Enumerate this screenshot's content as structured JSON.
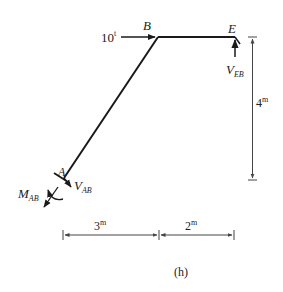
{
  "diagram": {
    "type": "structural-frame-free-body",
    "caption": "(h)",
    "nodes": {
      "A": {
        "label": "A"
      },
      "B": {
        "label": "B"
      },
      "E": {
        "label": "E"
      }
    },
    "load": {
      "value": "10",
      "unit": "t",
      "direction": "right",
      "at": "B"
    },
    "reactions": {
      "V_AB": {
        "main": "V",
        "sub": "AB"
      },
      "M_AB": {
        "main": "M",
        "sub": "AB"
      },
      "V_EB": {
        "main": "V",
        "sub": "EB"
      }
    },
    "dimensions": {
      "height": {
        "value": "4",
        "unit": "m"
      },
      "span_left": {
        "value": "3",
        "unit": "m"
      },
      "span_right": {
        "value": "2",
        "unit": "m"
      }
    },
    "colors": {
      "line": "#1a1a1a",
      "dim": "#555555",
      "background": "#ffffff"
    }
  }
}
